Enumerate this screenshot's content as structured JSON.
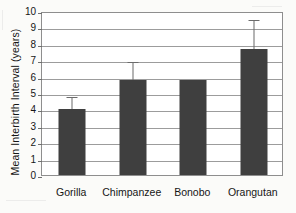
{
  "chart_data": {
    "type": "bar",
    "title": "",
    "xlabel": "",
    "ylabel": "Mean Interbirth Interval (years)",
    "categories": [
      "Gorilla",
      "Chimpanzee",
      "Bonobo",
      "Orangutan"
    ],
    "values": [
      4.0,
      5.8,
      5.8,
      7.7
    ],
    "errors_upper": [
      4.9,
      7.0,
      null,
      9.6
    ],
    "ylim": [
      0,
      10
    ],
    "ytick_labels": [
      "0",
      "1",
      "2",
      "3",
      "4",
      "5",
      "6",
      "7",
      "8",
      "9",
      "10"
    ],
    "ytick_values": [
      0,
      1,
      2,
      3,
      4,
      5,
      6,
      7,
      8,
      9,
      10
    ],
    "grid": true,
    "legend": false,
    "series": [
      {
        "name": "Mean Interbirth Interval",
        "values": [
          4.0,
          5.8,
          5.8,
          7.7
        ]
      }
    ],
    "colors": {
      "bar_fill": "#3f3f3f",
      "gridline": "#9c9c9c",
      "axis": "#8e8e8e",
      "error_bar": "#6b6b6b",
      "text": "#161616",
      "plot_background": "#ffffff",
      "page_background": "#fbfbf9"
    }
  }
}
